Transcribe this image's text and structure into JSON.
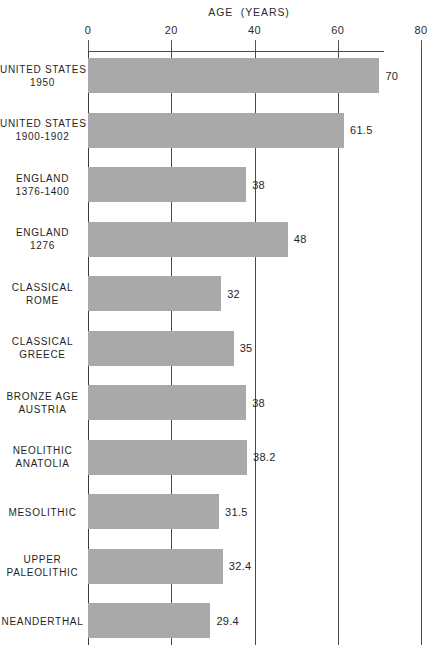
{
  "chart_data": {
    "type": "bar",
    "orientation": "horizontal",
    "title": "AGE  (YEARS)",
    "xlabel": "AGE (YEARS)",
    "ylabel": "",
    "xlim": [
      0,
      80
    ],
    "xticks": [
      0,
      20,
      40,
      60,
      80
    ],
    "xtick_labels": [
      "0",
      "20",
      "40",
      "60",
      "80"
    ],
    "grid": true,
    "grid_axis": "x",
    "legend": false,
    "bar_color": "#a9a9a9",
    "axis_color": "#4a4a4a",
    "categories": [
      "UNITED STATES\n1950",
      "UNITED STATES\n1900-1902",
      "ENGLAND\n1376-1400",
      "ENGLAND\n1276",
      "CLASSICAL\nROME",
      "CLASSICAL\nGREECE",
      "BRONZE AGE\nAUSTRIA",
      "NEOLITHIC\nANATOLIA",
      "MESOLITHIC",
      "UPPER\nPALEOLITHIC",
      "NEANDERTHAL"
    ],
    "values": [
      70,
      61.5,
      38,
      48,
      32,
      35,
      38,
      38.2,
      31.5,
      32.4,
      29.4
    ],
    "value_labels": [
      "70",
      "61.5",
      "38",
      "48",
      "32",
      "35",
      "38",
      "38.2",
      "31.5",
      "32.4",
      "29.4"
    ],
    "bars": [
      {
        "label": "UNITED STATES\n1950",
        "value": 70,
        "value_label": "70"
      },
      {
        "label": "UNITED STATES\n1900-1902",
        "value": 61.5,
        "value_label": "61.5"
      },
      {
        "label": "ENGLAND\n1376-1400",
        "value": 38,
        "value_label": "38"
      },
      {
        "label": "ENGLAND\n1276",
        "value": 48,
        "value_label": "48"
      },
      {
        "label": "CLASSICAL\nROME",
        "value": 32,
        "value_label": "32"
      },
      {
        "label": "CLASSICAL\nGREECE",
        "value": 35,
        "value_label": "35"
      },
      {
        "label": "BRONZE AGE\nAUSTRIA",
        "value": 38,
        "value_label": "38"
      },
      {
        "label": "NEOLITHIC\nANATOLIA",
        "value": 38.2,
        "value_label": "38.2"
      },
      {
        "label": "MESOLITHIC",
        "value": 31.5,
        "value_label": "31.5"
      },
      {
        "label": "UPPER\nPALEOLITHIC",
        "value": 32.4,
        "value_label": "32.4"
      },
      {
        "label": "NEANDERTHAL",
        "value": 29.4,
        "value_label": "29.4"
      }
    ]
  },
  "layout": {
    "plot_left_px": 88,
    "plot_right_px": 421,
    "baseline_y_px": 51,
    "grid_bottom_y_px": 645,
    "first_bar_top_px": 58,
    "row_pitch_px": 54.5,
    "bar_height_px": 35
  }
}
